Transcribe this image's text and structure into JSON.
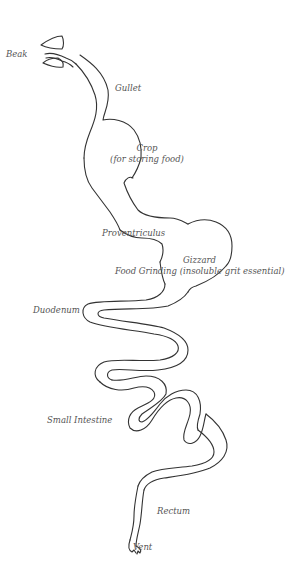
{
  "diagram": {
    "labels": {
      "beak": "Beak",
      "gullet": "Gullet",
      "crop_title": "Crop",
      "crop_sub": "(for storing food)",
      "proventriculus": "Proventriculus",
      "gizzard_title": "Gizzard",
      "gizzard_sub": "Food Grinding (insoluble grit essential)",
      "duodenum": "Duodenum",
      "small_intestine": "Small Intestine",
      "rectum": "Rectum",
      "vent": "Vent"
    },
    "colors": {
      "stroke": "#333333",
      "text": "#555555",
      "background": "#ffffff"
    }
  }
}
